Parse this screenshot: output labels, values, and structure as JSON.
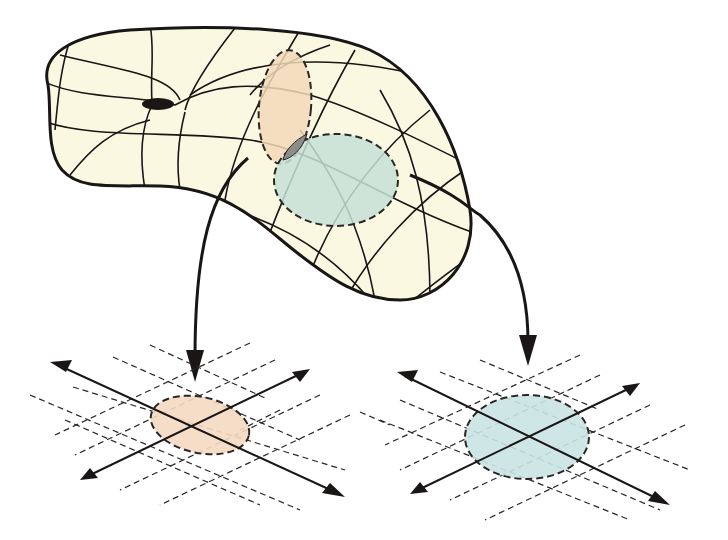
{
  "figure": {
    "colors": {
      "background": "#ffffff",
      "manifold_fill": "#fbf8e2",
      "outline": "#1a1616",
      "chart_left_fill": "#f2d9b8",
      "chart_right_fill": "#c5e0d6",
      "overlap_fill": "#8c8c88",
      "hole_fill": "#1a1616",
      "plane_left_oval": "#f5d9c2",
      "plane_right_oval": "#c9e3e2"
    },
    "manifold": {
      "shape": "kidney-shaped surface with one hole (genus-1 like)",
      "grid": "curvilinear coordinate lines"
    },
    "charts": [
      {
        "id": "chart-left",
        "shape": "dashed vertical ellipse",
        "color": "orange-tan"
      },
      {
        "id": "chart-right",
        "shape": "dashed ellipse",
        "color": "teal"
      }
    ],
    "mappings": [
      {
        "from": "chart-left",
        "to": "plane-left"
      },
      {
        "from": "chart-right",
        "to": "plane-right"
      }
    ],
    "planes": [
      {
        "id": "plane-left",
        "axes": 2,
        "dashed_grid": true,
        "oval_color": "peach"
      },
      {
        "id": "plane-right",
        "axes": 2,
        "dashed_grid": true,
        "oval_color": "light-teal"
      }
    ]
  }
}
